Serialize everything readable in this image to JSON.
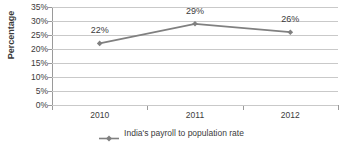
{
  "chart_data": {
    "type": "line",
    "title": "",
    "xlabel": "",
    "ylabel": "Percentage",
    "categories": [
      "2010",
      "2011",
      "2012"
    ],
    "series": [
      {
        "name": "India's payroll to population rate",
        "values": [
          22,
          29,
          26
        ],
        "point_labels": [
          "22%",
          "29%",
          "26%"
        ],
        "color": "#808080",
        "marker": "diamond"
      }
    ],
    "ylim": [
      0,
      35
    ],
    "ytick_values": [
      0,
      5,
      10,
      15,
      20,
      25,
      30,
      35
    ],
    "ytick_labels": [
      "0%",
      "5%",
      "10%",
      "15%",
      "20%",
      "25%",
      "30%",
      "35%"
    ],
    "grid": true,
    "grid_axis": "y",
    "legend_position": "bottom",
    "legend_entries": [
      "India's payroll to population rate"
    ]
  },
  "colors": {
    "series_line": "#808080",
    "gridline": "#c9c9c9",
    "axis": "#9a9a9a",
    "text": "#3b3b3b",
    "background": "#ffffff"
  }
}
